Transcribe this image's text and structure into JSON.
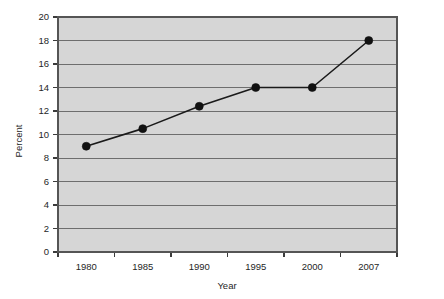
{
  "chart_data": {
    "type": "line",
    "title": "",
    "subtitle": "",
    "xlabel": "Year",
    "ylabel": "Percent",
    "categories": [
      "1980",
      "1985",
      "1990",
      "1995",
      "2000",
      "2007"
    ],
    "values": [
      9.0,
      10.5,
      12.4,
      14.0,
      14.0,
      18.0
    ],
    "series": [
      {
        "name": "Percent",
        "values": [
          9.0,
          10.5,
          12.4,
          14.0,
          14.0,
          18.0
        ]
      }
    ],
    "x_tick_labels": [
      "1980",
      "1985",
      "1990",
      "1995",
      "2000",
      "2007"
    ],
    "y_tick_labels": [
      "0",
      "2",
      "4",
      "6",
      "8",
      "10",
      "12",
      "14",
      "16",
      "18",
      "20"
    ],
    "y_tick_values": [
      0,
      2,
      4,
      6,
      8,
      10,
      12,
      14,
      16,
      18,
      20
    ],
    "ylim": [
      0,
      20
    ],
    "grid": "horizontal",
    "legend": "none",
    "marker": "filled-circle",
    "colors": {
      "plot_background": "#d6d6d6",
      "gridline": "#6e6e6e",
      "series_line": "#1a1a1a",
      "marker": "#111111",
      "axis": "#3b3b3b",
      "text": "#262626",
      "page_background": "#ffffff"
    }
  },
  "axes": {
    "y_title": "Percent",
    "x_title": "Year"
  }
}
